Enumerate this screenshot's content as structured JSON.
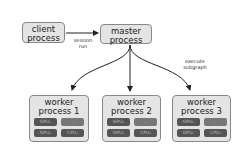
{
  "client": {
    "line1": "client",
    "line2": "process"
  },
  "master": {
    "line1": "master",
    "line2": "process"
  },
  "edge_labels": {
    "session_line1": "session",
    "session_line2": "run",
    "execute_line1": "execute",
    "execute_line2": "subgraph"
  },
  "workers": [
    {
      "line1": "worker",
      "line2": "process 1",
      "chips": [
        "GPU₀",
        "...",
        "GPU₁",
        "CPU₀"
      ]
    },
    {
      "line1": "worker",
      "line2": "process 2",
      "chips": [
        "GPU₀",
        "...",
        "GPU₁",
        "CPU₀"
      ]
    },
    {
      "line1": "worker",
      "line2": "process 3",
      "chips": [
        "GPU₀",
        "...",
        "GPU₁",
        "CPU₀"
      ]
    }
  ]
}
